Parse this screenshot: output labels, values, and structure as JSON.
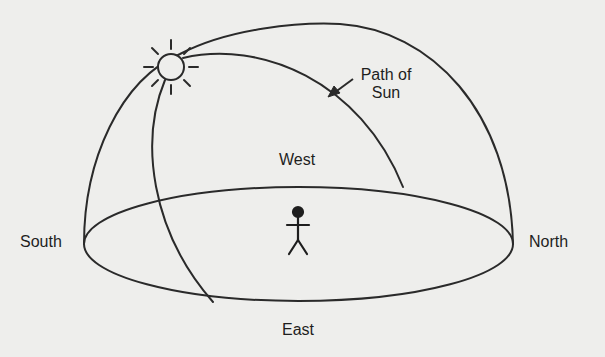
{
  "diagram": {
    "labels": {
      "south": "South",
      "north": "North",
      "west": "West",
      "east": "East",
      "path_line1": "Path of",
      "path_line2": "Sun"
    },
    "icons": {
      "sun": "sun-icon",
      "observer": "stick-figure-icon",
      "arrow": "arrow-icon"
    },
    "colors": {
      "background": "#eeeeec",
      "stroke": "#2a2a2a",
      "text": "#1e1e1e"
    }
  }
}
